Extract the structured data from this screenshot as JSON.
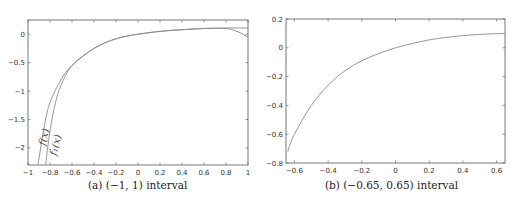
{
  "chart_data": [
    {
      "type": "line",
      "caption": "(a) (−1, 1) interval",
      "xlabel": "",
      "ylabel": "",
      "xlim": [
        -1,
        1
      ],
      "ylim": [
        -2.3,
        0.25
      ],
      "x_ticks": [
        "-1",
        "-0.8",
        "-0.6",
        "-0.4",
        "-0.2",
        "0",
        "0.2",
        "0.4",
        "0.6",
        "0.8",
        "1"
      ],
      "y_ticks": [
        "0",
        "-0.5",
        "-1",
        "-1.5",
        "-2"
      ],
      "grid": false,
      "annotations": [
        "f(x)",
        "f1(x)"
      ],
      "series": [
        {
          "name": "f(x)",
          "x": [
            -0.91,
            -0.85,
            -0.8,
            -0.7,
            -0.6,
            -0.4,
            -0.2,
            0,
            0.2,
            0.4,
            0.6,
            0.8,
            0.9,
            1.0
          ],
          "y": [
            -2.3,
            -1.6,
            -1.2,
            -0.8,
            -0.55,
            -0.25,
            -0.08,
            0.0,
            0.05,
            0.08,
            0.1,
            0.1,
            0.05,
            -0.05
          ]
        },
        {
          "name": "f1(x)",
          "x": [
            -0.84,
            -0.8,
            -0.75,
            -0.7,
            -0.6,
            -0.4,
            -0.2,
            0,
            0.2,
            0.4,
            0.6,
            0.8,
            1.0
          ],
          "y": [
            -2.3,
            -1.7,
            -1.2,
            -0.9,
            -0.55,
            -0.25,
            -0.08,
            0.0,
            0.05,
            0.08,
            0.1,
            0.11,
            0.11
          ]
        }
      ]
    },
    {
      "type": "line",
      "caption": "(b) (−0.65, 0.65) interval",
      "xlabel": "",
      "ylabel": "",
      "xlim": [
        -0.65,
        0.65
      ],
      "ylim": [
        -0.8,
        0.2
      ],
      "x_ticks": [
        "-0.6",
        "-0.4",
        "-0.2",
        "0",
        "0.2",
        "0.4",
        "0.6"
      ],
      "y_ticks": [
        "0.2",
        "0",
        "-0.2",
        "-0.4",
        "-0.6",
        "-0.8"
      ],
      "grid": false,
      "series": [
        {
          "name": "f(x) ≈ f1(x)",
          "x": [
            -0.64,
            -0.6,
            -0.5,
            -0.4,
            -0.3,
            -0.2,
            -0.1,
            0,
            0.1,
            0.2,
            0.3,
            0.4,
            0.5,
            0.65
          ],
          "y": [
            -0.72,
            -0.6,
            -0.4,
            -0.26,
            -0.16,
            -0.09,
            -0.04,
            0.0,
            0.03,
            0.055,
            0.072,
            0.085,
            0.093,
            0.1
          ]
        }
      ]
    }
  ],
  "labels": {
    "a": {
      "caption_prefix": "(a)",
      "caption_text": "(−1, 1) interval",
      "f": "f(x)",
      "f1": "f₁(x)"
    },
    "b": {
      "caption_prefix": "(b)",
      "caption_text": "(−0.65, 0.65) interval"
    }
  }
}
